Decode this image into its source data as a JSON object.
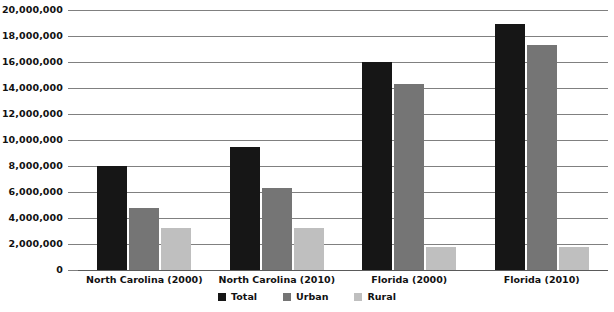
{
  "chart_data": {
    "type": "bar",
    "title": "",
    "subtitle": "",
    "xlabel": "",
    "ylabel": "",
    "orientation": "vertical",
    "grouping": "grouped",
    "grid": true,
    "legend_position": "bottom-center",
    "ylim": [
      0,
      20000000
    ],
    "ytick_step": 2000000,
    "categories": [
      "North Carolina (2000)",
      "North Carolina (2010)",
      "Florida (2000)",
      "Florida (2010)"
    ],
    "ytick_labels": [
      "20,000,000",
      "18,000,000",
      "16,000,000",
      "14,000,000",
      "12,000,000",
      "10,000,000",
      "8,000,000",
      "6,000,000",
      "4,000,000",
      "2,000,000",
      "0"
    ],
    "ytick_values": [
      20000000,
      18000000,
      16000000,
      14000000,
      12000000,
      10000000,
      8000000,
      6000000,
      4000000,
      2000000,
      0
    ],
    "series": [
      {
        "name": "Total",
        "color": "#161616",
        "values": [
          8000000,
          9500000,
          16000000,
          18900000
        ]
      },
      {
        "name": "Urban",
        "color": "#757575",
        "values": [
          4800000,
          6300000,
          14300000,
          17300000
        ]
      },
      {
        "name": "Rural",
        "color": "#bfbfbf",
        "values": [
          3200000,
          3200000,
          1800000,
          1800000
        ]
      }
    ]
  },
  "legend": {
    "items": [
      {
        "label": "Total",
        "key": "total"
      },
      {
        "label": "Urban",
        "key": "urban"
      },
      {
        "label": "Rural",
        "key": "rural"
      }
    ]
  },
  "colors": {
    "total": "#161616",
    "urban": "#757575",
    "rural": "#bfbfbf",
    "gridline": "#808080",
    "text": "#111111",
    "background": "#ffffff"
  }
}
